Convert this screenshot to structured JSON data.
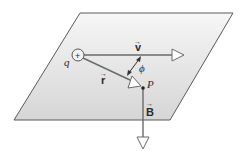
{
  "diagram": {
    "colors": {
      "plane_fill_top": "#f4f4f4",
      "plane_fill_bottom": "#d9d9d9",
      "plane_edge": "#5a5a5a",
      "line": "#6a6a6a",
      "arrow_fill": "#ffffff",
      "text": "#2b2b2b"
    },
    "plane": {
      "points": "80,13 233,13 170,120 14,120"
    },
    "charge": {
      "label": "q",
      "sign": "+",
      "cx": 78,
      "cy": 55,
      "r": 6
    },
    "vectors": {
      "v": {
        "label": "v",
        "arrow_mark": "→"
      },
      "r": {
        "label": "r",
        "arrow_mark": "→"
      },
      "B": {
        "label": "B",
        "arrow_mark": "→"
      }
    },
    "angle": {
      "label": "ϕ"
    },
    "point": {
      "label": "P",
      "x": 143,
      "y": 88
    }
  }
}
